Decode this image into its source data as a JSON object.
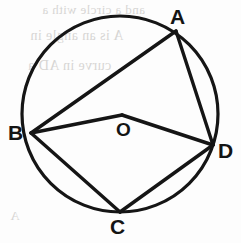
{
  "figure": {
    "stroke_color": "#151515",
    "background_color": "#fdfdfd",
    "labels": {
      "A": "A",
      "B": "B",
      "C": "C",
      "D": "D",
      "O": "O"
    },
    "circle": {
      "center_label": "O",
      "cx": 120,
      "cy": 114,
      "r": 98,
      "stroke_width": 3
    },
    "points": [
      {
        "name": "A",
        "x": 176,
        "y": 31,
        "label": "A",
        "label_x": 170,
        "label_y": 6
      },
      {
        "name": "B",
        "x": 31,
        "y": 133,
        "label": "B",
        "label_x": 8,
        "label_y": 122
      },
      {
        "name": "C",
        "x": 120,
        "y": 212,
        "label": "C",
        "label_x": 110,
        "label_y": 216
      },
      {
        "name": "D",
        "x": 213,
        "y": 145,
        "label": "D",
        "label_x": 218,
        "label_y": 140
      },
      {
        "name": "O",
        "x": 122,
        "y": 115,
        "label": "O",
        "label_x": 116,
        "label_y": 120
      }
    ],
    "segments": [
      {
        "name": "segment-AB",
        "from": "A",
        "to": "B"
      },
      {
        "name": "segment-AD",
        "from": "A",
        "to": "D"
      },
      {
        "name": "segment-BO",
        "from": "B",
        "to": "O"
      },
      {
        "name": "segment-OD",
        "from": "O",
        "to": "D"
      },
      {
        "name": "segment-BC",
        "from": "B",
        "to": "C"
      },
      {
        "name": "segment-CD",
        "from": "C",
        "to": "D"
      }
    ]
  },
  "background_bleed": {
    "note": "faint mirrored show-through text from reverse page side",
    "lines": [
      {
        "text": "and a circle with a",
        "x": 42,
        "y": 2,
        "size": 13
      },
      {
        "text": "A is an angle in",
        "x": 30,
        "y": 28,
        "size": 14
      },
      {
        "text": "curve in AD a",
        "x": 28,
        "y": 58,
        "size": 14
      },
      {
        "text": "A",
        "x": 10,
        "y": 208,
        "size": 13
      }
    ]
  }
}
